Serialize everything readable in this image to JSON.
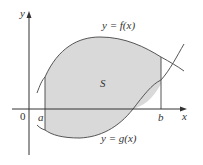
{
  "diagram": {
    "type": "area-between-curves",
    "region_label": "S",
    "curves": {
      "upper": {
        "label": "y = f(x)"
      },
      "lower": {
        "label": "y = g(x)"
      }
    },
    "axes": {
      "x_label": "x",
      "y_label": "y",
      "origin_label": "0"
    },
    "bounds": {
      "left": "a",
      "right": "b"
    },
    "colors": {
      "fill": "#d9d9d9",
      "stroke": "#555555",
      "axis": "#333333",
      "background": "#ffffff"
    }
  }
}
